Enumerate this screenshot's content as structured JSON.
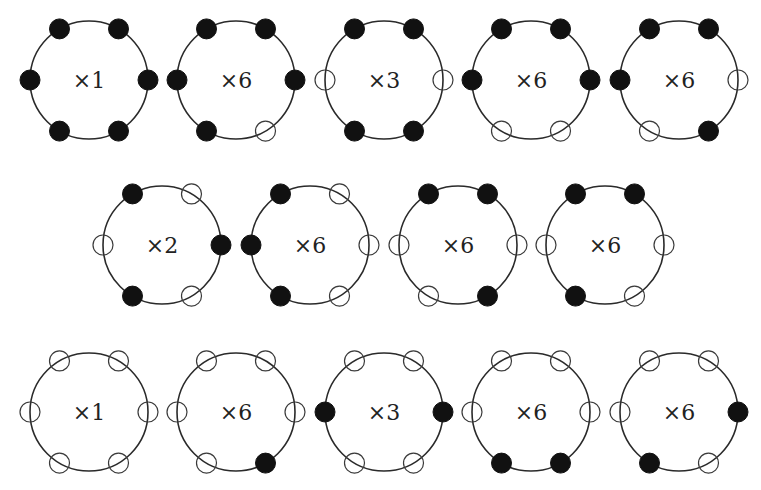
{
  "diagram": {
    "position_order": [
      "top-left",
      "top-right",
      "right",
      "bottom-right",
      "bottom-left",
      "left"
    ],
    "legend": {
      "filled": "occupied site (black dot)",
      "open": "empty site (open circle)"
    },
    "colors": {
      "filled": "#111111",
      "stroke": "#2a2a2a",
      "background": "#ffffff"
    },
    "rows": [
      {
        "y": 80,
        "rings": [
          {
            "x": 89,
            "label": "×1",
            "sites": [
              1,
              1,
              1,
              1,
              1,
              1
            ]
          },
          {
            "x": 236,
            "label": "×6",
            "sites": [
              1,
              1,
              1,
              0,
              1,
              1
            ]
          },
          {
            "x": 384,
            "label": "×3",
            "sites": [
              1,
              1,
              0,
              1,
              1,
              0
            ]
          },
          {
            "x": 531,
            "label": "×6",
            "sites": [
              1,
              1,
              1,
              0,
              0,
              1
            ]
          },
          {
            "x": 679,
            "label": "×6",
            "sites": [
              1,
              1,
              0,
              1,
              0,
              1
            ]
          }
        ]
      },
      {
        "y": 245,
        "rings": [
          {
            "x": 162,
            "label": "×2",
            "sites": [
              1,
              0,
              1,
              0,
              1,
              0
            ]
          },
          {
            "x": 310,
            "label": "×6",
            "sites": [
              1,
              0,
              0,
              0,
              1,
              1
            ]
          },
          {
            "x": 458,
            "label": "×6",
            "sites": [
              1,
              1,
              0,
              1,
              0,
              0
            ]
          },
          {
            "x": 605,
            "label": "×6",
            "sites": [
              1,
              1,
              0,
              0,
              1,
              0
            ]
          }
        ]
      },
      {
        "y": 412,
        "rings": [
          {
            "x": 89,
            "label": "×1",
            "sites": [
              0,
              0,
              0,
              0,
              0,
              0
            ]
          },
          {
            "x": 236,
            "label": "×6",
            "sites": [
              0,
              0,
              0,
              1,
              0,
              0
            ]
          },
          {
            "x": 384,
            "label": "×3",
            "sites": [
              0,
              0,
              1,
              0,
              0,
              1
            ]
          },
          {
            "x": 531,
            "label": "×6",
            "sites": [
              0,
              0,
              0,
              1,
              1,
              0
            ]
          },
          {
            "x": 679,
            "label": "×6",
            "sites": [
              0,
              0,
              1,
              0,
              1,
              0
            ]
          }
        ]
      }
    ]
  }
}
